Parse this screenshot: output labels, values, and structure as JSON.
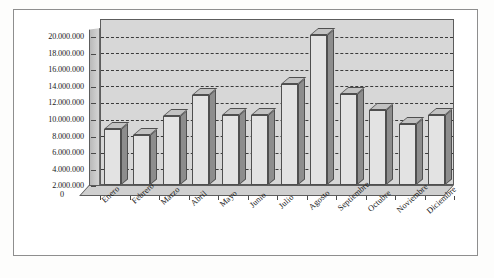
{
  "chart_data": {
    "type": "bar",
    "title": "",
    "xlabel": "",
    "ylabel": "",
    "categories": [
      "Enero",
      "Febrero",
      "Marzo",
      "Abril",
      "Mayo",
      "Junio",
      "Julio",
      "Agosto",
      "Septiembre",
      "Octubre",
      "Noviembre",
      "Diciembre"
    ],
    "values": [
      6700000,
      6000000,
      8300000,
      10900000,
      8400000,
      8400000,
      12200000,
      18100000,
      11000000,
      9000000,
      7300000,
      8400000
    ],
    "ylim": [
      0,
      20000000
    ],
    "ytick_values": [
      0,
      2000000,
      4000000,
      6000000,
      8000000,
      10000000,
      12000000,
      14000000,
      16000000,
      18000000,
      20000000
    ],
    "ytick_labels": [
      "0",
      "2.000.000",
      "4.000.000",
      "6.000.000",
      "8.000.000",
      "10.000.000",
      "12.000.000",
      "14.000.000",
      "16.000.000",
      "18.000.000",
      "20.000.000"
    ],
    "grid": true,
    "grid_style": "dashed-horizontal",
    "legend": "none",
    "style_3d": true,
    "colors": {
      "bar_front": "#e3e3e3",
      "bar_side": "#8d8d8d",
      "bar_top": "#c2c2c2",
      "plot_background": "#d7d7d7",
      "gridline": "#3b3b3b",
      "axis": "#4a4a4a",
      "frame": "#8e8e8e",
      "page_background": "#ffffff",
      "text": "#1b1b1b"
    }
  }
}
